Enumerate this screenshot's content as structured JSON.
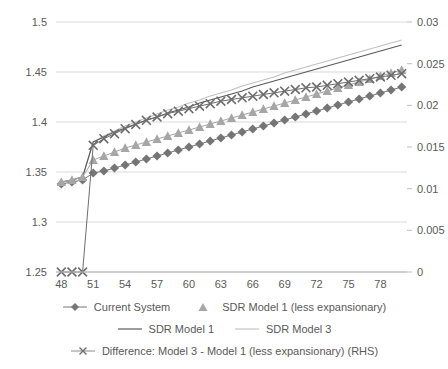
{
  "chart_data": {
    "type": "line",
    "title": "",
    "xlabel": "",
    "ylabel": "",
    "y2label": "",
    "grid": true,
    "legend_position": "bottom",
    "x": [
      48,
      49,
      50,
      51,
      52,
      53,
      54,
      55,
      56,
      57,
      58,
      59,
      60,
      61,
      62,
      63,
      64,
      65,
      66,
      67,
      68,
      69,
      70,
      71,
      72,
      73,
      74,
      75,
      76,
      77,
      78,
      79,
      80
    ],
    "xlim": [
      47.5,
      80.5
    ],
    "xticks": [
      48,
      51,
      54,
      57,
      60,
      63,
      66,
      69,
      72,
      75,
      78
    ],
    "ylim": [
      1.25,
      1.5
    ],
    "yticks": [
      1.25,
      1.3,
      1.35,
      1.4,
      1.45,
      1.5
    ],
    "ytick_labels": [
      "1.25",
      "1.3",
      "1.35",
      "1.4",
      "1.45",
      "1.5"
    ],
    "y2lim": [
      0,
      0.03
    ],
    "y2ticks": [
      0,
      0.005,
      0.01,
      0.015,
      0.02,
      0.025,
      0.03
    ],
    "y2tick_labels": [
      "0",
      "0.005",
      "0.01",
      "0.015",
      "0.02",
      "0.025",
      "0.03"
    ],
    "series": [
      {
        "name": "Current System",
        "marker": "diamond",
        "color": "#757575",
        "axis": "left",
        "values": [
          1.338,
          1.34,
          1.342,
          1.349,
          1.351,
          1.354,
          1.357,
          1.36,
          1.363,
          1.366,
          1.369,
          1.372,
          1.375,
          1.378,
          1.381,
          1.384,
          1.387,
          1.39,
          1.393,
          1.396,
          1.399,
          1.402,
          1.405,
          1.408,
          1.411,
          1.414,
          1.417,
          1.42,
          1.423,
          1.426,
          1.429,
          1.432,
          1.435
        ]
      },
      {
        "name": "SDR Model 1 (less expansionary)",
        "marker": "triangle",
        "color": "#a6a6a6",
        "axis": "left",
        "values": [
          1.34,
          1.342,
          1.345,
          1.362,
          1.366,
          1.37,
          1.374,
          1.377,
          1.38,
          1.383,
          1.386,
          1.389,
          1.392,
          1.395,
          1.398,
          1.401,
          1.404,
          1.407,
          1.41,
          1.413,
          1.416,
          1.419,
          1.422,
          1.425,
          1.428,
          1.431,
          1.434,
          1.437,
          1.44,
          1.443,
          1.446,
          1.449,
          1.452
        ]
      },
      {
        "name": "SDR Model 1",
        "marker": "none",
        "color": "#5a5a5a",
        "axis": "left",
        "values": [
          1.34,
          1.342,
          1.345,
          1.38,
          1.385,
          1.39,
          1.394,
          1.398,
          1.402,
          1.405,
          1.409,
          1.412,
          1.415,
          1.419,
          1.422,
          1.425,
          1.428,
          1.431,
          1.435,
          1.438,
          1.441,
          1.444,
          1.447,
          1.45,
          1.453,
          1.456,
          1.459,
          1.462,
          1.465,
          1.468,
          1.471,
          1.474,
          1.477
        ]
      },
      {
        "name": "SDR Model 3",
        "marker": "none",
        "color": "#bfbfbf",
        "axis": "left",
        "values": [
          1.34,
          1.342,
          1.345,
          1.38,
          1.386,
          1.391,
          1.396,
          1.4,
          1.404,
          1.408,
          1.412,
          1.415,
          1.419,
          1.422,
          1.426,
          1.429,
          1.432,
          1.436,
          1.439,
          1.442,
          1.445,
          1.449,
          1.452,
          1.455,
          1.458,
          1.461,
          1.464,
          1.467,
          1.47,
          1.473,
          1.476,
          1.479,
          1.482
        ]
      },
      {
        "name": "Difference: Model 3 - Model 1 (less expansionary) (RHS)",
        "marker": "x",
        "color": "#6e6e6e",
        "axis": "right",
        "values": [
          0,
          0,
          0,
          0.0152,
          0.016,
          0.0166,
          0.0172,
          0.0177,
          0.0182,
          0.0186,
          0.019,
          0.0193,
          0.0196,
          0.0199,
          0.0202,
          0.0205,
          0.0207,
          0.0209,
          0.0211,
          0.0213,
          0.0215,
          0.0217,
          0.0219,
          0.0221,
          0.0222,
          0.0224,
          0.0226,
          0.0228,
          0.023,
          0.0232,
          0.0234,
          0.0236,
          0.0238
        ]
      }
    ]
  },
  "legend": {
    "rows": [
      [
        {
          "label": "Current System",
          "key": "diamond-marker-key",
          "color": "#757575",
          "style": "line-marker"
        },
        {
          "label": "SDR Model 1 (less expansionary)",
          "key": "triangle-marker-key",
          "color": "#a6a6a6",
          "style": "marker-only"
        }
      ],
      [
        {
          "label": "SDR Model 1",
          "key": "solid-line-key",
          "color": "#5a5a5a",
          "style": "line"
        },
        {
          "label": "SDR Model 3",
          "key": "light-line-key",
          "color": "#bfbfbf",
          "style": "line"
        }
      ],
      [
        {
          "label": "Difference: Model 3 - Model 1 (less expansionary) (RHS)",
          "key": "x-marker-key",
          "color": "#6e6e6e",
          "style": "line-marker"
        }
      ]
    ]
  }
}
